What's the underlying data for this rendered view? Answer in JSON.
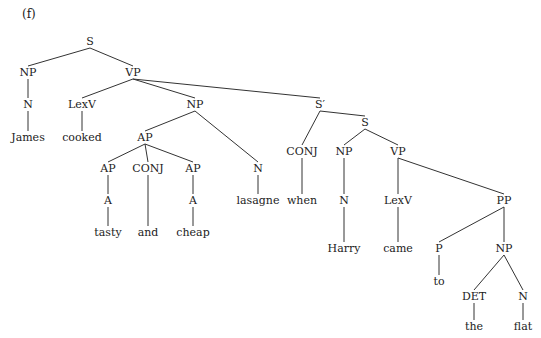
{
  "figure": {
    "label": "(f)"
  },
  "tree": {
    "nodes": [
      {
        "id": "S",
        "label": "S",
        "x": 90,
        "y": 45
      },
      {
        "id": "NP1",
        "label": "NP",
        "x": 28,
        "y": 76
      },
      {
        "id": "VP1",
        "label": "VP",
        "x": 133,
        "y": 76
      },
      {
        "id": "N1",
        "label": "N",
        "x": 28,
        "y": 108
      },
      {
        "id": "James",
        "label": "James",
        "x": 28,
        "y": 141
      },
      {
        "id": "LexV1",
        "label": "LexV",
        "x": 82,
        "y": 108
      },
      {
        "id": "cooked",
        "label": "cooked",
        "x": 82,
        "y": 141
      },
      {
        "id": "NP2",
        "label": "NP",
        "x": 195,
        "y": 108
      },
      {
        "id": "AP0",
        "label": "AP",
        "x": 145,
        "y": 141
      },
      {
        "id": "AP1",
        "label": "AP",
        "x": 108,
        "y": 172
      },
      {
        "id": "CONJ1",
        "label": "CONJ",
        "x": 148,
        "y": 172
      },
      {
        "id": "AP2",
        "label": "AP",
        "x": 193,
        "y": 172
      },
      {
        "id": "A1",
        "label": "A",
        "x": 108,
        "y": 204
      },
      {
        "id": "A2",
        "label": "A",
        "x": 193,
        "y": 204
      },
      {
        "id": "tasty",
        "label": "tasty",
        "x": 108,
        "y": 236
      },
      {
        "id": "and",
        "label": "and",
        "x": 148,
        "y": 236
      },
      {
        "id": "cheap",
        "label": "cheap",
        "x": 193,
        "y": 236
      },
      {
        "id": "N2",
        "label": "N",
        "x": 258,
        "y": 172
      },
      {
        "id": "lasagne",
        "label": "lasagne",
        "x": 258,
        "y": 204
      },
      {
        "id": "Sbar",
        "label": "S′",
        "x": 320,
        "y": 108
      },
      {
        "id": "CONJ2",
        "label": "CONJ",
        "x": 302,
        "y": 155
      },
      {
        "id": "when",
        "label": "when",
        "x": 302,
        "y": 204
      },
      {
        "id": "S2",
        "label": "S",
        "x": 365,
        "y": 126
      },
      {
        "id": "NP3",
        "label": "NP",
        "x": 344,
        "y": 155
      },
      {
        "id": "N3",
        "label": "N",
        "x": 344,
        "y": 204
      },
      {
        "id": "Harry",
        "label": "Harry",
        "x": 344,
        "y": 252
      },
      {
        "id": "VP2",
        "label": "VP",
        "x": 398,
        "y": 155
      },
      {
        "id": "LexV2",
        "label": "LexV",
        "x": 398,
        "y": 204
      },
      {
        "id": "came",
        "label": "came",
        "x": 398,
        "y": 252
      },
      {
        "id": "PP",
        "label": "PP",
        "x": 504,
        "y": 204
      },
      {
        "id": "P",
        "label": "P",
        "x": 439,
        "y": 252
      },
      {
        "id": "to",
        "label": "to",
        "x": 439,
        "y": 285
      },
      {
        "id": "NP4",
        "label": "NP",
        "x": 504,
        "y": 252
      },
      {
        "id": "DET",
        "label": "DET",
        "x": 474,
        "y": 300
      },
      {
        "id": "N4",
        "label": "N",
        "x": 523,
        "y": 300
      },
      {
        "id": "the",
        "label": "the",
        "x": 474,
        "y": 330
      },
      {
        "id": "flat",
        "label": "flat",
        "x": 523,
        "y": 330
      }
    ],
    "edges": [
      [
        "S",
        "NP1"
      ],
      [
        "S",
        "VP1"
      ],
      [
        "NP1",
        "N1"
      ],
      [
        "N1",
        "James"
      ],
      [
        "VP1",
        "LexV1"
      ],
      [
        "LexV1",
        "cooked"
      ],
      [
        "VP1",
        "NP2"
      ],
      [
        "VP1",
        "Sbar"
      ],
      [
        "NP2",
        "AP0"
      ],
      [
        "NP2",
        "N2"
      ],
      [
        "AP0",
        "AP1"
      ],
      [
        "AP0",
        "CONJ1"
      ],
      [
        "AP0",
        "AP2"
      ],
      [
        "AP1",
        "A1"
      ],
      [
        "A1",
        "tasty"
      ],
      [
        "CONJ1",
        "and"
      ],
      [
        "AP2",
        "A2"
      ],
      [
        "A2",
        "cheap"
      ],
      [
        "N2",
        "lasagne"
      ],
      [
        "Sbar",
        "CONJ2"
      ],
      [
        "Sbar",
        "S2"
      ],
      [
        "CONJ2",
        "when"
      ],
      [
        "S2",
        "NP3"
      ],
      [
        "S2",
        "VP2"
      ],
      [
        "NP3",
        "N3"
      ],
      [
        "N3",
        "Harry"
      ],
      [
        "VP2",
        "LexV2"
      ],
      [
        "VP2",
        "PP"
      ],
      [
        "LexV2",
        "came"
      ],
      [
        "PP",
        "P"
      ],
      [
        "PP",
        "NP4"
      ],
      [
        "P",
        "to"
      ],
      [
        "NP4",
        "DET"
      ],
      [
        "NP4",
        "N4"
      ],
      [
        "DET",
        "the"
      ],
      [
        "N4",
        "flat"
      ]
    ]
  }
}
